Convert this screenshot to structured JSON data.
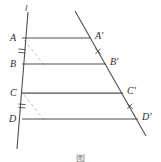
{
  "figure": {
    "type": "geometry-diagram",
    "background_color": "#ffffff",
    "stroke_color": "#4a4a4a",
    "dashed_color": "#b0b0b0",
    "label_color": "#2b2b2b",
    "caption": "图",
    "line_label": "l",
    "points": [
      {
        "id": "A",
        "label": "A",
        "x": 22,
        "y": 38,
        "label_x": 10,
        "label_y": 33
      },
      {
        "id": "B",
        "label": "B",
        "x": 22,
        "y": 64,
        "label_x": 10,
        "label_y": 59
      },
      {
        "id": "C",
        "label": "C",
        "x": 22,
        "y": 93,
        "label_x": 10,
        "label_y": 88
      },
      {
        "id": "D",
        "label": "D",
        "x": 22,
        "y": 119,
        "label_x": 10,
        "label_y": 114
      },
      {
        "id": "A1",
        "label": "A'",
        "x": 91,
        "y": 38,
        "label_x": 95,
        "label_y": 32
      },
      {
        "id": "B1",
        "label": "B'",
        "x": 106,
        "y": 64,
        "label_x": 110,
        "label_y": 58
      },
      {
        "id": "C1",
        "label": "C'",
        "x": 123,
        "y": 93,
        "label_x": 127,
        "label_y": 87
      },
      {
        "id": "D1",
        "label": "D'",
        "x": 138,
        "y": 119,
        "label_x": 142,
        "label_y": 113
      }
    ],
    "parallel_lines": [
      {
        "id": "AA1",
        "from": "A",
        "to": "A1",
        "x1": 22,
        "y1": 38,
        "x2": 91,
        "y2": 38
      },
      {
        "id": "BB1",
        "from": "B",
        "to": "B1",
        "x1": 22,
        "y1": 64,
        "x2": 106,
        "y2": 64
      },
      {
        "id": "CC1",
        "from": "C",
        "to": "C1",
        "x1": 22,
        "y1": 93,
        "x2": 123,
        "y2": 93
      },
      {
        "id": "DD1",
        "from": "D",
        "to": "D1",
        "x1": 22,
        "y1": 119,
        "x2": 138,
        "y2": 119
      }
    ],
    "transversals": [
      {
        "id": "left-transversal",
        "label": "l",
        "x1": 28,
        "y1": 12,
        "x2": 17,
        "y2": 149
      },
      {
        "id": "right-transversal",
        "label": "",
        "x1": 75,
        "y1": 11,
        "x2": 146,
        "y2": 136
      }
    ],
    "dashed_lines": [
      {
        "id": "dashed-A-to-B-side",
        "x1": 24,
        "y1": 40,
        "x2": 45,
        "y2": 66
      },
      {
        "id": "dashed-C-to-D-side",
        "x1": 24,
        "y1": 95,
        "x2": 45,
        "y2": 121
      }
    ],
    "tick_marks": [
      {
        "id": "tick-left-AB",
        "kind": "double-hash",
        "x": 22,
        "y": 51,
        "angle": 5
      },
      {
        "id": "tick-left-CD",
        "kind": "double-hash",
        "x": 22,
        "y": 106,
        "angle": 5
      },
      {
        "id": "tick-right-AB",
        "kind": "cross",
        "x": 98,
        "y": 51
      },
      {
        "id": "tick-right-CD",
        "kind": "cross",
        "x": 130,
        "y": 106
      }
    ],
    "line_label_pos": {
      "x": 25,
      "y": 6
    },
    "caption_pos": {
      "y": 152
    }
  }
}
